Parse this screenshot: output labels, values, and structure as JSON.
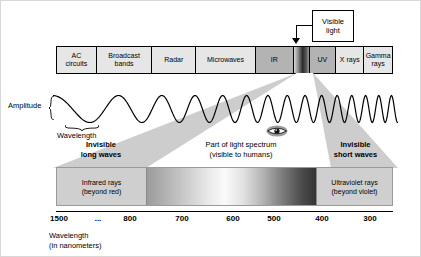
{
  "callout": {
    "line1": "Visible",
    "line2": "light",
    "arrow_icon": "down-arrow-icon"
  },
  "spectrum_bands": [
    {
      "id": "ac-circuits",
      "line1": "AC",
      "line2": "circuits",
      "width": 40,
      "fill": "#e6e6e6"
    },
    {
      "id": "broadcast",
      "line1": "Broadcast",
      "line2": "bands",
      "width": 56,
      "fill": "#e6e6e6"
    },
    {
      "id": "radar",
      "line1": "Radar",
      "line2": "",
      "width": 44,
      "fill": "#e6e6e6"
    },
    {
      "id": "microwaves",
      "line1": "Microwaves",
      "line2": "",
      "width": 60,
      "fill": "#e6e6e6"
    },
    {
      "id": "ir",
      "line1": "IR",
      "line2": "",
      "width": 38,
      "fill": "#b3b3b3"
    },
    {
      "id": "visible",
      "line1": "",
      "line2": "",
      "width": 16,
      "fill": "gradient"
    },
    {
      "id": "uv",
      "line1": "UV",
      "line2": "",
      "width": 27,
      "fill": "#b3b3b3"
    },
    {
      "id": "x-rays",
      "line1": "X rays",
      "line2": "",
      "width": 28,
      "fill": "#e6e6e6"
    },
    {
      "id": "gamma-rays",
      "line1": "Gamma",
      "line2": "rays",
      "width": 28,
      "fill": "#e6e6e6"
    }
  ],
  "wave": {
    "amplitude_label": "Amplitude",
    "wavelength_label": "Wavelength"
  },
  "regions": {
    "left": {
      "line1": "Invisible",
      "line2": "long waves"
    },
    "middle": {
      "line1": "Part of light spectrum",
      "line2": "(visible to humans)"
    },
    "right": {
      "line1": "Invisible",
      "line2": "short waves"
    },
    "eye_icon": "eye-icon"
  },
  "panel": {
    "infrared": {
      "line1": "Infrared rays",
      "line2": "(beyond red)"
    },
    "ultraviolet": {
      "line1": "Ultraviolet rays",
      "line2": "(beyond violet)"
    }
  },
  "scale": {
    "ticks": [
      {
        "label": "1500",
        "x": 58
      },
      {
        "label": "...",
        "x": 97
      },
      {
        "label": "800",
        "x": 129
      },
      {
        "label": "700",
        "x": 181
      },
      {
        "label": "600",
        "x": 232
      },
      {
        "label": "500",
        "x": 273
      },
      {
        "label": "400",
        "x": 321
      },
      {
        "label": "300",
        "x": 369
      }
    ],
    "caption_line1": "Wavelength",
    "caption_line2": "(in nanometers)"
  },
  "chart_data": {
    "type": "diagram",
    "xlabel": "Wavelength (in nanometers)",
    "categories": [
      "AC circuits",
      "Broadcast bands",
      "Radar",
      "Microwaves",
      "IR",
      "Visible light",
      "UV",
      "X rays",
      "Gamma rays"
    ],
    "tick_values": [
      1500,
      null,
      800,
      700,
      600,
      500,
      400,
      300
    ],
    "tick_labels": [
      "1500",
      "...",
      "800",
      "700",
      "600",
      "500",
      "400",
      "300"
    ],
    "annotations": [
      "Visible light",
      "Amplitude",
      "Wavelength",
      "Invisible long waves",
      "Part of light spectrum (visible to humans)",
      "Invisible short waves",
      "Infrared rays (beyond red)",
      "Ultraviolet rays (beyond violet)"
    ]
  }
}
